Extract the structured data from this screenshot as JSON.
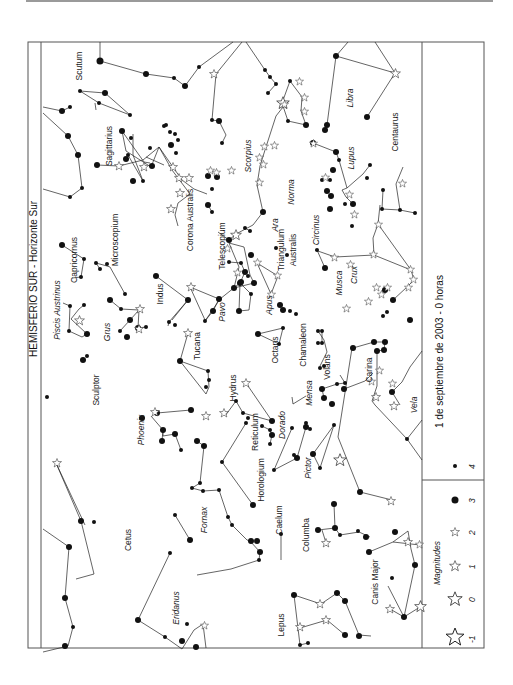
{
  "title": "HEMISFERIO SUR - Horizonte Sur",
  "date_caption": "1 de septiembre de 2003 - 0 horas",
  "legend": {
    "title": "Magnitudes",
    "items": [
      {
        "label": "-1",
        "symbol": "star-large"
      },
      {
        "label": "0",
        "symbol": "star-medium"
      },
      {
        "label": "1",
        "symbol": "star-small"
      },
      {
        "label": "2",
        "symbol": "star-tiny"
      },
      {
        "label": "3",
        "symbol": "dot-large"
      },
      {
        "label": "4",
        "symbol": "dot-small"
      }
    ]
  },
  "constellations": [
    {
      "name": "Scutum",
      "x": 82,
      "y": 66,
      "italic": false
    },
    {
      "name": "Libra",
      "x": 353,
      "y": 98,
      "italic": true
    },
    {
      "name": "Sagittarius",
      "x": 112,
      "y": 146,
      "italic": false
    },
    {
      "name": "Scorpius",
      "x": 251,
      "y": 156,
      "italic": true
    },
    {
      "name": "Centaurus",
      "x": 398,
      "y": 132,
      "italic": false
    },
    {
      "name": "Lupus",
      "x": 354,
      "y": 158,
      "italic": true
    },
    {
      "name": "Corona Australis",
      "x": 193,
      "y": 220,
      "italic": false
    },
    {
      "name": "Telescopium",
      "x": 225,
      "y": 246,
      "italic": false
    },
    {
      "name": "Ara",
      "x": 278,
      "y": 225,
      "italic": true
    },
    {
      "name": "Norma",
      "x": 294,
      "y": 192,
      "italic": true
    },
    {
      "name": "Triangulum",
      "x": 284,
      "y": 250,
      "italic": false
    },
    {
      "name": "Australis",
      "x": 296,
      "y": 250,
      "italic": false
    },
    {
      "name": "Circinus",
      "x": 319,
      "y": 230,
      "italic": true
    },
    {
      "name": "Microscopium",
      "x": 118,
      "y": 240,
      "italic": false
    },
    {
      "name": "Capricornus",
      "x": 77,
      "y": 260,
      "italic": false
    },
    {
      "name": "Piscis Austrinus",
      "x": 60,
      "y": 310,
      "italic": true
    },
    {
      "name": "Indus",
      "x": 163,
      "y": 294,
      "italic": false
    },
    {
      "name": "Grus",
      "x": 110,
      "y": 332,
      "italic": true
    },
    {
      "name": "Pavo",
      "x": 225,
      "y": 312,
      "italic": true
    },
    {
      "name": "Apus",
      "x": 272,
      "y": 305,
      "italic": true
    },
    {
      "name": "Tucana",
      "x": 200,
      "y": 346,
      "italic": false
    },
    {
      "name": "Musca",
      "x": 342,
      "y": 283,
      "italic": true
    },
    {
      "name": "Crux",
      "x": 357,
      "y": 275,
      "italic": true
    },
    {
      "name": "Octans",
      "x": 278,
      "y": 350,
      "italic": false
    },
    {
      "name": "Chamaleon",
      "x": 306,
      "y": 345,
      "italic": false
    },
    {
      "name": "Sculptor",
      "x": 99,
      "y": 390,
      "italic": false
    },
    {
      "name": "Hydrus",
      "x": 236,
      "y": 388,
      "italic": false
    },
    {
      "name": "Volans",
      "x": 330,
      "y": 367,
      "italic": false
    },
    {
      "name": "Carina",
      "x": 372,
      "y": 370,
      "italic": false
    },
    {
      "name": "Mensa",
      "x": 312,
      "y": 393,
      "italic": true
    },
    {
      "name": "Phoenix",
      "x": 144,
      "y": 430,
      "italic": true
    },
    {
      "name": "Reticulum",
      "x": 258,
      "y": 432,
      "italic": false
    },
    {
      "name": "Dorado",
      "x": 285,
      "y": 425,
      "italic": true
    },
    {
      "name": "Vela",
      "x": 417,
      "y": 405,
      "italic": true
    },
    {
      "name": "Horologium",
      "x": 264,
      "y": 480,
      "italic": false
    },
    {
      "name": "Pictor",
      "x": 311,
      "y": 468,
      "italic": true
    },
    {
      "name": "Fornax",
      "x": 207,
      "y": 520,
      "italic": true
    },
    {
      "name": "Caelum",
      "x": 282,
      "y": 520,
      "italic": false
    },
    {
      "name": "Columba",
      "x": 309,
      "y": 535,
      "italic": false
    },
    {
      "name": "Cetus",
      "x": 131,
      "y": 540,
      "italic": false
    },
    {
      "name": "Eridanus",
      "x": 179,
      "y": 608,
      "italic": true
    },
    {
      "name": "Canis Major",
      "x": 378,
      "y": 582,
      "italic": false
    },
    {
      "name": "Lepus",
      "x": 284,
      "y": 625,
      "italic": false
    }
  ],
  "colors": {
    "ink": "#111111",
    "frame": "#555555",
    "rule": "#9a9a9a"
  }
}
